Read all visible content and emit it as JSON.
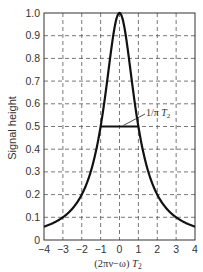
{
  "chart_data": {
    "type": "line",
    "title": "",
    "xlabel": "(2πν−ω) T2",
    "xlabel_parts": {
      "main": "(2πν−ω)",
      "italic": "T",
      "sub": "2"
    },
    "ylabel": "Signal height",
    "xlim": [
      -4,
      4
    ],
    "ylim": [
      0,
      1.0
    ],
    "x_ticks": [
      -4,
      -3,
      -2,
      -1,
      0,
      1,
      2,
      3,
      4
    ],
    "x_tick_labels": [
      "−4",
      "−3",
      "−2",
      "−1",
      "0",
      "1",
      "2",
      "3",
      "4"
    ],
    "y_ticks": [
      0,
      0.1,
      0.2,
      0.3,
      0.4,
      0.5,
      0.6,
      0.7,
      0.8,
      0.9,
      1.0
    ],
    "y_tick_labels": [
      "0",
      "0.1",
      "0.2",
      "0.3",
      "0.4",
      "0.5",
      "0.6",
      "0.7",
      "0.8",
      "0.9",
      "1.0"
    ],
    "grid": true,
    "grid_style": "dashed",
    "legend": null,
    "series": [
      {
        "name": "Lorentzian line shape",
        "function": "1/(1+x^2)",
        "x": [
          -4,
          -3,
          -2,
          -1.5,
          -1,
          -0.5,
          0,
          0.5,
          1,
          1.5,
          2,
          3,
          4
        ],
        "values": [
          0.059,
          0.1,
          0.2,
          0.308,
          0.5,
          0.8,
          1.0,
          0.8,
          0.5,
          0.308,
          0.2,
          0.1,
          0.059
        ],
        "color": "#111111"
      }
    ],
    "annotations": [
      {
        "type": "segment",
        "name": "full width at half maximum",
        "x": [
          -1,
          1
        ],
        "y": [
          0.5,
          0.5
        ],
        "label": "1/πT2",
        "label_parts": {
          "main": "1/π",
          "italic": "T",
          "sub": "2"
        }
      }
    ]
  }
}
